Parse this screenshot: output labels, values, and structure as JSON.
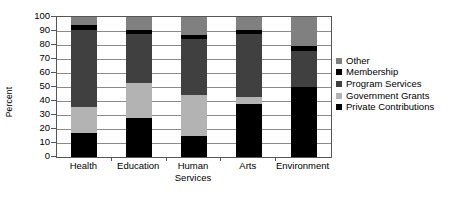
{
  "chart_data": {
    "type": "bar",
    "title": "",
    "subtitle": "",
    "xlabel": "",
    "ylabel": "Percent",
    "ylim": [
      0,
      100
    ],
    "ytick_labels": [
      "100",
      "90",
      "80",
      "70",
      "60",
      "50",
      "40",
      "30",
      "20",
      "10",
      "0"
    ],
    "ytick_values": [
      100,
      90,
      80,
      70,
      60,
      50,
      40,
      30,
      20,
      10,
      0
    ],
    "grid": true,
    "stacked": true,
    "legend_position": "right",
    "categories": [
      "Health",
      "Education",
      "Human Services",
      "Arts",
      "Environment"
    ],
    "series": [
      {
        "name": "Private Contributions",
        "color": "#000000",
        "values": [
          17,
          28,
          15,
          38,
          50
        ]
      },
      {
        "name": "Government Grants",
        "color": "#b3b3b3",
        "values": [
          19,
          25,
          29,
          5,
          0
        ]
      },
      {
        "name": "Program Services",
        "color": "#404040",
        "values": [
          55,
          35,
          40,
          45,
          26
        ]
      },
      {
        "name": "Membership",
        "color": "#000000",
        "values": [
          3,
          3,
          3,
          3,
          3
        ]
      },
      {
        "name": "Other",
        "color": "#808080",
        "values": [
          6,
          9,
          13,
          9,
          21
        ]
      }
    ]
  },
  "axis": {
    "y_title": "Percent"
  },
  "legend": {
    "items": [
      {
        "label": "Other",
        "color": "#808080"
      },
      {
        "label": "Membership",
        "color": "#000000"
      },
      {
        "label": "Program Services",
        "color": "#404040"
      },
      {
        "label": "Government Grants",
        "color": "#b3b3b3"
      },
      {
        "label": "Private Contributions",
        "color": "#000000"
      }
    ]
  }
}
